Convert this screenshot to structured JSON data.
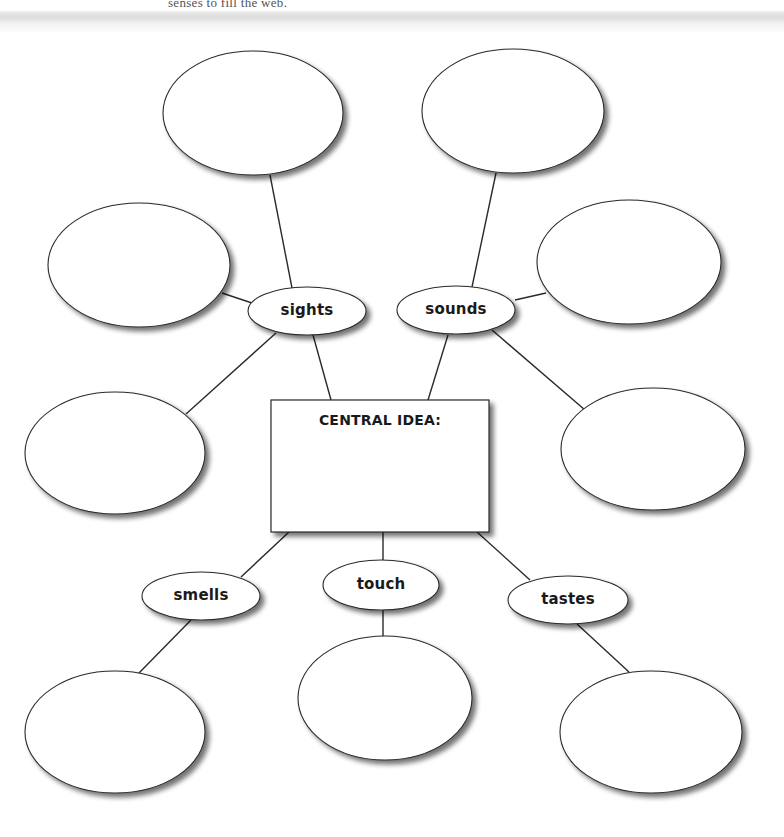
{
  "header": {
    "instruction_fragment": "senses to fill the web."
  },
  "central": {
    "label": "CENTRAL IDEA:",
    "x": 271,
    "y": 400,
    "w": 218,
    "h": 132
  },
  "categories": [
    {
      "key": "sights",
      "label": "sights",
      "cx": 307,
      "cy": 311,
      "rx": 59,
      "ry": 24
    },
    {
      "key": "sounds",
      "label": "sounds",
      "cx": 456,
      "cy": 310,
      "rx": 59,
      "ry": 24
    },
    {
      "key": "smells",
      "label": "smells",
      "cx": 201,
      "cy": 596,
      "rx": 59,
      "ry": 24
    },
    {
      "key": "touch",
      "label": "touch",
      "cx": 381,
      "cy": 585,
      "rx": 58,
      "ry": 25
    },
    {
      "key": "tastes",
      "label": "tastes",
      "cx": 568,
      "cy": 600,
      "rx": 60,
      "ry": 24
    }
  ],
  "detail_bubbles": [
    {
      "parent": "sights",
      "cx": 253,
      "cy": 113,
      "rx": 90,
      "ry": 62
    },
    {
      "parent": "sights",
      "cx": 139,
      "cy": 265,
      "rx": 91,
      "ry": 62
    },
    {
      "parent": "sights",
      "cx": 115,
      "cy": 453,
      "rx": 90,
      "ry": 61
    },
    {
      "parent": "sounds",
      "cx": 513,
      "cy": 111,
      "rx": 91,
      "ry": 62
    },
    {
      "parent": "sounds",
      "cx": 629,
      "cy": 262,
      "rx": 92,
      "ry": 62
    },
    {
      "parent": "sounds",
      "cx": 653,
      "cy": 449,
      "rx": 92,
      "ry": 61
    },
    {
      "parent": "smells",
      "cx": 115,
      "cy": 732,
      "rx": 90,
      "ry": 61
    },
    {
      "parent": "touch",
      "cx": 385,
      "cy": 698,
      "rx": 87,
      "ry": 62
    },
    {
      "parent": "tastes",
      "cx": 651,
      "cy": 732,
      "rx": 91,
      "ry": 61
    }
  ],
  "connectors": [
    {
      "from": "sights-top",
      "x1": 270,
      "y1": 175,
      "x2": 292,
      "y2": 288
    },
    {
      "from": "sights-left",
      "x1": 222,
      "y1": 293,
      "x2": 252,
      "y2": 303
    },
    {
      "from": "sights-lower",
      "x1": 186,
      "y1": 414,
      "x2": 276,
      "y2": 333
    },
    {
      "from": "sights-central",
      "x1": 313,
      "y1": 335,
      "x2": 331,
      "y2": 400
    },
    {
      "from": "sounds-top",
      "x1": 496,
      "y1": 173,
      "x2": 472,
      "y2": 287
    },
    {
      "from": "sounds-right",
      "x1": 546,
      "y1": 293,
      "x2": 515,
      "y2": 300
    },
    {
      "from": "sounds-lower",
      "x1": 585,
      "y1": 410,
      "x2": 492,
      "y2": 330
    },
    {
      "from": "sounds-central",
      "x1": 448,
      "y1": 335,
      "x2": 428,
      "y2": 400
    },
    {
      "from": "central-smells",
      "x1": 289,
      "y1": 532,
      "x2": 241,
      "y2": 577
    },
    {
      "from": "central-touch",
      "x1": 383,
      "y1": 532,
      "x2": 383,
      "y2": 560
    },
    {
      "from": "central-tastes",
      "x1": 477,
      "y1": 532,
      "x2": 530,
      "y2": 580
    },
    {
      "from": "smells-bottom",
      "x1": 191,
      "y1": 620,
      "x2": 139,
      "y2": 673
    },
    {
      "from": "touch-bottom",
      "x1": 383,
      "y1": 610,
      "x2": 383,
      "y2": 637
    },
    {
      "from": "tastes-bottom",
      "x1": 577,
      "y1": 624,
      "x2": 629,
      "y2": 672
    }
  ],
  "colors": {
    "stroke": "#2a2a2a",
    "fill": "#ffffff",
    "shadow": "#8a8a8a",
    "text": "#1a1a1a"
  }
}
